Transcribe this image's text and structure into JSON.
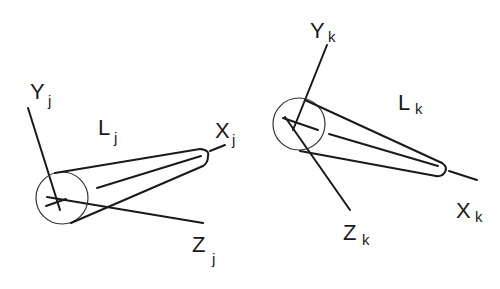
{
  "diagram": {
    "frames": [
      {
        "id": "j",
        "link_label": "L",
        "link_sub": "j",
        "axes": [
          {
            "label": "Y",
            "sub": "j"
          },
          {
            "label": "X",
            "sub": "j"
          },
          {
            "label": "Z",
            "sub": "j"
          }
        ]
      },
      {
        "id": "k",
        "link_label": "L",
        "link_sub": "k",
        "axes": [
          {
            "label": "Y",
            "sub": "k"
          },
          {
            "label": "X",
            "sub": "k"
          },
          {
            "label": "Z",
            "sub": "k"
          }
        ]
      }
    ],
    "colors": {
      "stroke": "#1a1a1a",
      "background": "#ffffff"
    }
  }
}
